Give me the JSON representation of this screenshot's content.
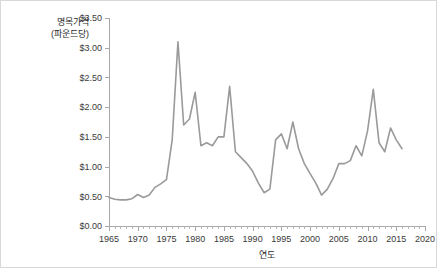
{
  "chart_data": {
    "type": "line",
    "title": "",
    "xlabel": "연도",
    "ylabel": "명목가격\n(파운드당)",
    "ylabel_line1": "명목가격",
    "ylabel_line2": "(파운드당)",
    "xlim": [
      1965,
      2020
    ],
    "ylim": [
      0.0,
      3.5
    ],
    "grid": false,
    "legend": null,
    "line_color": "#9a9a9a",
    "axis_color": "#a8a8a8",
    "y_ticks": [
      0.0,
      0.5,
      1.0,
      1.5,
      2.0,
      2.5,
      3.0,
      3.5
    ],
    "y_tick_labels": [
      "$0.00",
      "$0.50",
      "$1.00",
      "$1.50",
      "$2.00",
      "$2.50",
      "$3.00",
      "$3.50"
    ],
    "x_ticks": [
      1965,
      1970,
      1975,
      1980,
      1985,
      1990,
      1995,
      2000,
      2005,
      2010,
      2015,
      2020
    ],
    "x_tick_labels": [
      "1965",
      "1970",
      "1975",
      "1980",
      "1985",
      "1990",
      "1995",
      "2000",
      "2005",
      "2010",
      "2015",
      "2020"
    ],
    "x_minor_tick_step": 1,
    "x": [
      1965,
      1966,
      1967,
      1968,
      1969,
      1970,
      1971,
      1972,
      1973,
      1974,
      1975,
      1976,
      1977,
      1978,
      1979,
      1980,
      1981,
      1982,
      1983,
      1984,
      1985,
      1986,
      1987,
      1988,
      1989,
      1990,
      1991,
      1992,
      1993,
      1994,
      1995,
      1996,
      1997,
      1998,
      1999,
      2000,
      2001,
      2002,
      2003,
      2004,
      2005,
      2006,
      2007,
      2008,
      2009,
      2010,
      2011,
      2012,
      2013,
      2014,
      2015,
      2016
    ],
    "values": [
      0.48,
      0.45,
      0.44,
      0.44,
      0.46,
      0.53,
      0.48,
      0.52,
      0.65,
      0.71,
      0.78,
      1.45,
      3.1,
      1.7,
      1.8,
      2.25,
      1.35,
      1.4,
      1.35,
      1.5,
      1.5,
      2.35,
      1.25,
      1.15,
      1.05,
      0.92,
      0.72,
      0.56,
      0.62,
      1.45,
      1.55,
      1.3,
      1.75,
      1.3,
      1.05,
      0.88,
      0.72,
      0.52,
      0.62,
      0.8,
      1.05,
      1.05,
      1.1,
      1.35,
      1.18,
      1.6,
      2.3,
      1.4,
      1.25,
      1.65,
      1.45,
      1.3
    ],
    "series_name": "명목가격"
  }
}
